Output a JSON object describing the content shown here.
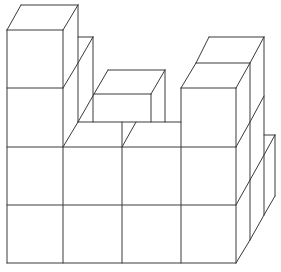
{
  "diagram": {
    "type": "oblique-cube-stack",
    "colors": {
      "stroke": "#3a3a3a",
      "background": "#ffffff"
    },
    "lines": [
      [
        7,
        30,
        7,
        263
      ],
      [
        63,
        30,
        63,
        263
      ],
      [
        122,
        122,
        122,
        263
      ],
      [
        181,
        88,
        181,
        263
      ],
      [
        236,
        88,
        236,
        263
      ],
      [
        7,
        30,
        63,
        30
      ],
      [
        7,
        88,
        63,
        88
      ],
      [
        7,
        147,
        236,
        147
      ],
      [
        7,
        205,
        236,
        205
      ],
      [
        7,
        263,
        236,
        263
      ],
      [
        7,
        30,
        21,
        5
      ],
      [
        21,
        5,
        78,
        5
      ],
      [
        63,
        30,
        78,
        5
      ],
      [
        78,
        5,
        78,
        122
      ],
      [
        63,
        88,
        78,
        63
      ],
      [
        78,
        37,
        93,
        37
      ],
      [
        93,
        37,
        93,
        122
      ],
      [
        78,
        63,
        93,
        37
      ],
      [
        63,
        147,
        78,
        122
      ],
      [
        78,
        122,
        181,
        122
      ],
      [
        122,
        147,
        136,
        122
      ],
      [
        78,
        122,
        94,
        94
      ],
      [
        94,
        94,
        151,
        94
      ],
      [
        108,
        70,
        165,
        70
      ],
      [
        94,
        94,
        108,
        70
      ],
      [
        151,
        94,
        165,
        70
      ],
      [
        151,
        94,
        151,
        122
      ],
      [
        165,
        70,
        165,
        122
      ],
      [
        181,
        88,
        196,
        63
      ],
      [
        196,
        63,
        250,
        63
      ],
      [
        209,
        37,
        264,
        37
      ],
      [
        196,
        63,
        209,
        37
      ],
      [
        250,
        63,
        264,
        37
      ],
      [
        236,
        88,
        250,
        63
      ],
      [
        181,
        88,
        236,
        88
      ],
      [
        250,
        63,
        250,
        240
      ],
      [
        264,
        37,
        264,
        215
      ],
      [
        236,
        147,
        250,
        122
      ],
      [
        236,
        205,
        250,
        180
      ],
      [
        250,
        122,
        264,
        96
      ],
      [
        250,
        180,
        264,
        155
      ],
      [
        236,
        263,
        250,
        240
      ],
      [
        250,
        240,
        264,
        215
      ],
      [
        264,
        135,
        275,
        135
      ],
      [
        275,
        135,
        275,
        196
      ],
      [
        264,
        155,
        275,
        135
      ],
      [
        264,
        215,
        275,
        196
      ]
    ]
  }
}
